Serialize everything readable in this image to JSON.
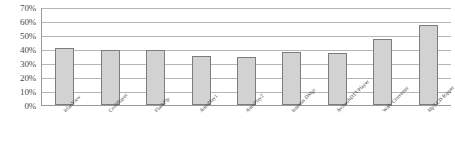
{
  "chart_data": {
    "type": "bar",
    "title": "",
    "xlabel": "",
    "ylabel": "",
    "ylim": [
      0,
      70
    ],
    "ytick_labels": [
      "70%",
      "60%",
      "50%",
      "40%",
      "30%",
      "20%",
      "10%",
      "0%"
    ],
    "ytick_values": [
      70,
      60,
      50,
      40,
      30,
      20,
      10,
      0
    ],
    "grid": true,
    "legend": "none",
    "bar_fill_color": "#d2d2d2",
    "bar_border_color": "#7d7d7d",
    "gridline_color": "#b6b6b6",
    "axis_color": "#9a9a9a",
    "categories": [
      "IrfanView",
      "CoolPlayer",
      "FlashPlp",
      "AutoPlay1",
      "AutoPlay2",
      "Internet DMgr",
      "AviosoftDTVPlayer",
      "WAV Converter",
      "Mp3 CD Ripper"
    ],
    "values": [
      41,
      39,
      39,
      35,
      34,
      38,
      37,
      47,
      57
    ]
  }
}
